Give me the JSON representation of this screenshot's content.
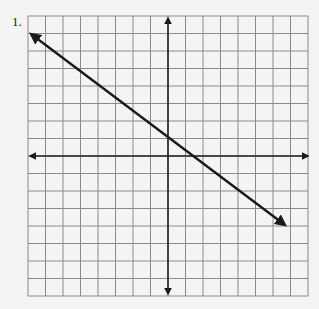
{
  "problem": {
    "number_label": "1."
  },
  "graph": {
    "grid_columns": 16,
    "grid_rows": 16,
    "x_range_units": [
      -8,
      8
    ],
    "y_range_units": [
      -8,
      8
    ],
    "grid_color": "#8a8a8a",
    "axis_color": "#222222",
    "line_color": "#1a1a1a",
    "line": {
      "description": "straight line with arrowheads at both ends, decreasing from upper left to lower right",
      "approx_start_grid": [
        -8,
        7
      ],
      "approx_end_grid": [
        6.5,
        -4
      ]
    }
  }
}
